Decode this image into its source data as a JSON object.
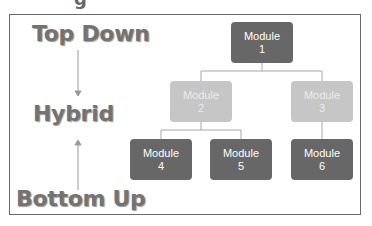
{
  "diagram": {
    "partial_glyph": "g",
    "labels": {
      "top_down": "Top Down",
      "hybrid": "Hybrid",
      "bottom_up": "Bottom Up"
    },
    "modules": [
      {
        "id": 1,
        "name": "Module",
        "number": "1",
        "shade": "dark"
      },
      {
        "id": 2,
        "name": "Module",
        "number": "2",
        "shade": "light"
      },
      {
        "id": 3,
        "name": "Module",
        "number": "3",
        "shade": "light"
      },
      {
        "id": 4,
        "name": "Module",
        "number": "4",
        "shade": "dark"
      },
      {
        "id": 5,
        "name": "Module",
        "number": "5",
        "shade": "dark"
      },
      {
        "id": 6,
        "name": "Module",
        "number": "6",
        "shade": "dark"
      }
    ],
    "edges": [
      [
        1,
        2
      ],
      [
        1,
        3
      ],
      [
        2,
        4
      ],
      [
        2,
        5
      ],
      [
        3,
        6
      ]
    ],
    "colors": {
      "dark_box": "#676767",
      "light_box": "#c6c6c6",
      "label_text": "#737373",
      "connector": "#a8a8a8"
    }
  }
}
